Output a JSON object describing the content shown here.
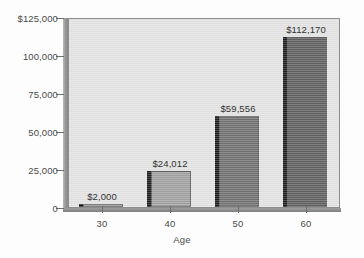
{
  "chart_data": {
    "type": "bar",
    "title": "",
    "xlabel": "Age",
    "ylabel": "",
    "categories": [
      "30",
      "40",
      "50",
      "60"
    ],
    "values": [
      2000,
      24012,
      59556,
      112170
    ],
    "value_labels": [
      "$2,000",
      "$24,012",
      "$59,556",
      "$112,170"
    ],
    "ylim": [
      0,
      125000
    ],
    "yticks": [
      0,
      25000,
      50000,
      75000,
      100000,
      125000
    ],
    "ytick_labels": [
      "0",
      "25,000",
      "50,000",
      "75,000",
      "100,000",
      "$125,000"
    ],
    "xtick_labels": [
      "30",
      "40",
      "50",
      "60"
    ],
    "grid": false,
    "legend": false,
    "bar_colors": [
      "#a8a8a8",
      "#a0a0a0",
      "#6f6f6f",
      "#5e5e5e"
    ],
    "plot_background": "#e2e2e2",
    "axis_color": "#8d8d8d",
    "text_color": "#4a4a4a"
  },
  "axes": {
    "y_axis_name": "dollars-axis",
    "x_axis_name": "age-axis"
  }
}
